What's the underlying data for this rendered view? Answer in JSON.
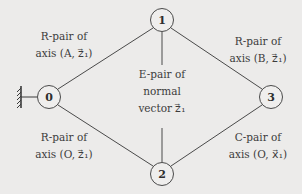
{
  "diagram": {
    "type": "graph",
    "nodes": [
      {
        "id": "0",
        "label": "0",
        "x": 49,
        "y": 97,
        "grounded": true
      },
      {
        "id": "1",
        "label": "1",
        "x": 162,
        "y": 20
      },
      {
        "id": "2",
        "label": "2",
        "x": 162,
        "y": 174
      },
      {
        "id": "3",
        "label": "3",
        "x": 271,
        "y": 97
      }
    ],
    "edges": [
      {
        "from": "0",
        "to": "1",
        "label_line1": "R-pair of",
        "label_line2": "axis (A, z⃗1)"
      },
      {
        "from": "1",
        "to": "3",
        "label_line1": "R-pair of",
        "label_line2": "axis (B, z⃗1)"
      },
      {
        "from": "1",
        "to": "2",
        "label_line1": "E-pair of",
        "label_line2": "normal",
        "label_line3": "vector z⃗1"
      },
      {
        "from": "0",
        "to": "2",
        "label_line1": "R-pair of",
        "label_line2": "axis (O, z⃗1)"
      },
      {
        "from": "2",
        "to": "3",
        "label_line1": "C-pair of",
        "label_line2": "axis (O, x⃗1)"
      }
    ],
    "ground_icon": "ground-hatch-icon"
  },
  "labels": {
    "e01": {
      "l1": "R-pair of",
      "l2": "axis (A, z⃗₁)"
    },
    "e13": {
      "l1": "R-pair of",
      "l2": "axis (B, z⃗₁)"
    },
    "e12": {
      "l1": "E-pair of",
      "l2": "normal",
      "l3": "vector z⃗₁"
    },
    "e02": {
      "l1": "R-pair of",
      "l2": "axis (O, z⃗₁)"
    },
    "e23": {
      "l1": "C-pair of",
      "l2": "axis (O, x⃗₁)"
    }
  },
  "node_labels": {
    "n0": "0",
    "n1": "1",
    "n2": "2",
    "n3": "3"
  }
}
